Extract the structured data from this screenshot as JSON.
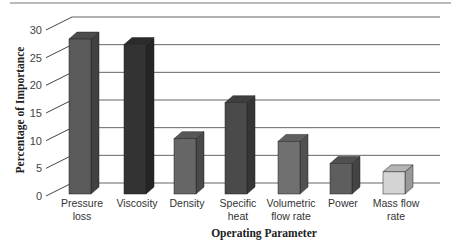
{
  "chart_data": {
    "type": "bar",
    "style": "3d-column",
    "title": "",
    "xlabel": "Operating Parameter",
    "ylabel": "Percentage of Importance",
    "ylim": [
      0,
      30
    ],
    "yticks": [
      0,
      5,
      10,
      15,
      20,
      25,
      30
    ],
    "grid": true,
    "legend": null,
    "categories": [
      [
        "Pressure",
        "loss"
      ],
      [
        "Viscosity"
      ],
      [
        "Density"
      ],
      [
        "Specific",
        "heat"
      ],
      [
        "Volumetric",
        "flow rate"
      ],
      [
        "Power"
      ],
      [
        "Mass flow",
        "rate"
      ]
    ],
    "category_names": [
      "Pressure loss",
      "Viscosity",
      "Density",
      "Specific heat",
      "Volumetric flow rate",
      "Power",
      "Mass flow rate"
    ],
    "values": [
      28,
      27,
      10,
      16.5,
      9.5,
      5.5,
      4
    ],
    "colors": [
      "#5a5a5a",
      "#333333",
      "#666666",
      "#4a4a4a",
      "#707070",
      "#5e5e5e",
      "#d4d4d4"
    ]
  }
}
